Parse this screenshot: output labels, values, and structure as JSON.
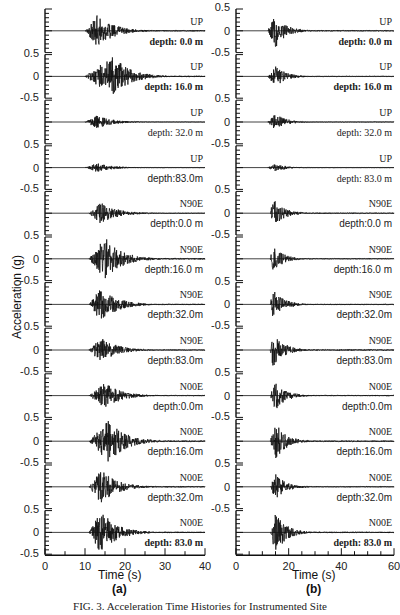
{
  "chart_data": [
    {
      "type": "line",
      "panel": "(a)",
      "xlabel": "Time (s)",
      "ylabel": "Acceleration (g)",
      "xlim": [
        0,
        40
      ],
      "xticks": [
        0,
        10,
        20,
        30,
        40
      ],
      "ylim": [
        -0.5,
        0.5
      ],
      "yticks": [
        -0.5,
        0,
        0.5
      ],
      "series": [
        {
          "component": "UP",
          "depth": "depth: 0.0 m",
          "onset_s": 10,
          "peak_s": 13,
          "peak_g": 0.4
        },
        {
          "component": "UP",
          "depth": "depth: 16.0 m",
          "onset_s": 10,
          "peak_s": 17,
          "peak_g": 0.5
        },
        {
          "component": "UP",
          "depth": "depth: 32.0 m",
          "onset_s": 10,
          "peak_s": 13,
          "peak_g": 0.15
        },
        {
          "component": "UP",
          "depth": "depth:83.0m",
          "onset_s": 10,
          "peak_s": 13,
          "peak_g": 0.1
        },
        {
          "component": "N90E",
          "depth": "depth:0.0 m",
          "onset_s": 11,
          "peak_s": 14,
          "peak_g": 0.25
        },
        {
          "component": "N90E",
          "depth": "depth:16.0 m",
          "onset_s": 11,
          "peak_s": 15,
          "peak_g": 0.5
        },
        {
          "component": "N90E",
          "depth": "depth:32.0m",
          "onset_s": 11,
          "peak_s": 14,
          "peak_g": 0.4
        },
        {
          "component": "N90E",
          "depth": "depth:83.0m",
          "onset_s": 11,
          "peak_s": 14,
          "peak_g": 0.3
        },
        {
          "component": "N00E",
          "depth": "depth:0.0m",
          "onset_s": 11,
          "peak_s": 15,
          "peak_g": 0.3
        },
        {
          "component": "N00E",
          "depth": "depth:16.0m",
          "onset_s": 11,
          "peak_s": 16,
          "peak_g": 0.5
        },
        {
          "component": "N00E",
          "depth": "depth:32.0m",
          "onset_s": 11,
          "peak_s": 14,
          "peak_g": 0.4
        },
        {
          "component": "N00E",
          "depth": "depth: 83.0 m",
          "onset_s": 11,
          "peak_s": 14,
          "peak_g": 0.5
        }
      ]
    },
    {
      "type": "line",
      "panel": "(b)",
      "xlabel": "Time (s)",
      "ylabel": "Acceleration (g)",
      "xlim": [
        0,
        60
      ],
      "xticks": [
        0,
        20,
        40,
        60
      ],
      "ylim": [
        -0.5,
        0.5
      ],
      "yticks": [
        -0.5,
        0,
        0.5
      ],
      "series": [
        {
          "component": "UP",
          "depth": "depth: 0.0 m",
          "onset_s": 12,
          "peak_s": 15,
          "peak_g": 0.4
        },
        {
          "component": "UP",
          "depth": "depth: 16.0 m",
          "onset_s": 12,
          "peak_s": 15,
          "peak_g": 0.25
        },
        {
          "component": "UP",
          "depth": "depth: 32.0 m",
          "onset_s": 12,
          "peak_s": 15,
          "peak_g": 0.2
        },
        {
          "component": "UP",
          "depth": "depth: 83.0 m",
          "onset_s": 12,
          "peak_s": 15,
          "peak_g": 0.1
        },
        {
          "component": "N90E",
          "depth": "depth:0.0 m",
          "onset_s": 13,
          "peak_s": 14,
          "peak_g": 0.35
        },
        {
          "component": "N90E",
          "depth": "depth:16.0 m",
          "onset_s": 13,
          "peak_s": 14,
          "peak_g": 0.3
        },
        {
          "component": "N90E",
          "depth": "depth:32.0m",
          "onset_s": 13,
          "peak_s": 14,
          "peak_g": 0.35
        },
        {
          "component": "N90E",
          "depth": "depth:83.0m",
          "onset_s": 13,
          "peak_s": 14,
          "peak_g": 0.45
        },
        {
          "component": "N00E",
          "depth": "depth:0.0m",
          "onset_s": 13,
          "peak_s": 15,
          "peak_g": 0.35
        },
        {
          "component": "N00E",
          "depth": "depth:16.0m",
          "onset_s": 13,
          "peak_s": 15,
          "peak_g": 0.45
        },
        {
          "component": "N00E",
          "depth": "depth:32.0m",
          "onset_s": 13,
          "peak_s": 15,
          "peak_g": 0.3
        },
        {
          "component": "N00E",
          "depth": "depth: 83.0 m",
          "onset_s": 13,
          "peak_s": 15,
          "peak_g": 0.5
        }
      ]
    }
  ],
  "labels": {
    "ylabel": "Acceleration (g)",
    "xlabel": "Time (s)",
    "panel_a": "(a)",
    "panel_b": "(b)",
    "caption": "FIG. 3. Acceleration Time Histories for Instrumented Site"
  }
}
